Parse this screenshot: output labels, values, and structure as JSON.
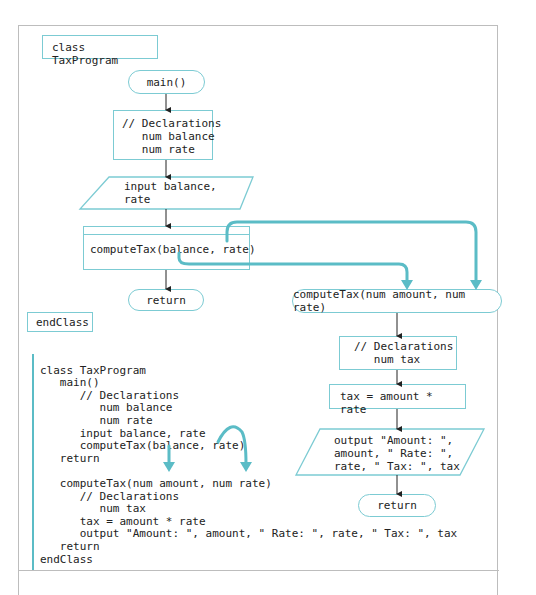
{
  "flowchart": {
    "class_start": "class TaxProgram",
    "class_end": "endClass",
    "main": {
      "start": "main()",
      "declarations": [
        "// Declarations",
        "   num balance",
        "   num rate"
      ],
      "input": [
        "input balance,",
        "rate"
      ],
      "call": "computeTax(balance, rate)",
      "end": "return"
    },
    "method": {
      "header": "computeTax(num amount, num rate)",
      "declarations": [
        "// Declarations",
        "   num tax"
      ],
      "assign": "tax = amount * rate",
      "output": [
        "output \"Amount: \",",
        "amount, \" Rate: \",",
        "rate, \" Tax: \", tax"
      ],
      "end": "return"
    }
  },
  "pseudocode": {
    "lines": [
      "class TaxProgram",
      "   main()",
      "      // Declarations",
      "         num balance",
      "         num rate",
      "      input balance, rate",
      "      computeTax(balance, rate)",
      "   return",
      "",
      "   computeTax(num amount, num rate)",
      "      // Declarations",
      "         num tax",
      "      tax = amount * rate",
      "      output \"Amount: \", amount, \" Rate: \", rate, \" Tax: \", tax",
      "   return",
      "endClass"
    ]
  },
  "colors": {
    "accent": "#5bbcc6",
    "shape_border": "#7ccbd3",
    "text": "#222222",
    "frame": "#bdbdbd"
  }
}
